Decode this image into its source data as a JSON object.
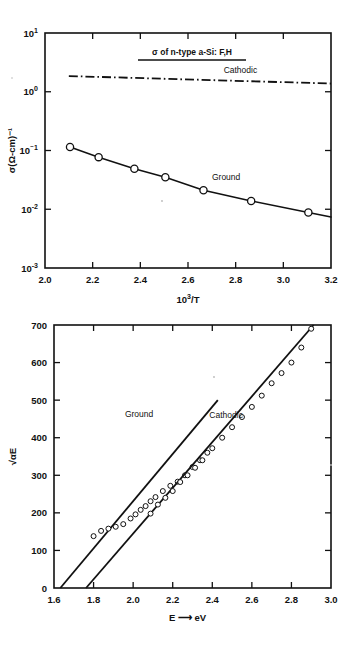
{
  "figure": {
    "name": "conductivity-and-tauc-plots-amorphous-silicon",
    "background_color": "#ffffff",
    "ink_color": "#111111"
  },
  "chart_data": [
    {
      "id": "top",
      "type": "line",
      "title": "σ of n-type a-Si: F,H",
      "title_underlined": true,
      "xlabel": "10³/T",
      "ylabel": "σ(Ω-cm)⁻¹",
      "xlim": [
        2.0,
        3.2
      ],
      "ylim": [
        0.001,
        10
      ],
      "yscale": "log",
      "grid": false,
      "legend_position": "inline-annotation",
      "xticks": [
        2.0,
        2.2,
        2.4,
        2.6,
        2.8,
        3.0,
        3.2
      ],
      "xticklabels": [
        "2.0",
        "2.2",
        "2.4",
        "2.6",
        "2.8",
        "3.0",
        "3.2"
      ],
      "yticks": [
        10,
        1,
        0.1,
        0.01,
        0.001
      ],
      "yticklabels": [
        "10¹",
        "10⁰",
        "10⁻¹",
        "10⁻²",
        "10⁻³"
      ],
      "series": [
        {
          "name": "Cathodic",
          "style": "dash-dot",
          "marker": "none",
          "label_x": 2.82,
          "label_y": 2.05,
          "x": [
            2.1,
            3.2
          ],
          "values": [
            1.85,
            1.38
          ]
        },
        {
          "name": "Ground",
          "style": "solid",
          "marker": "open-circle",
          "label_x": 2.76,
          "label_y": 0.031,
          "x": [
            2.105,
            2.225,
            2.375,
            2.505,
            2.665,
            2.865,
            3.105
          ],
          "values": [
            0.115,
            0.077,
            0.049,
            0.035,
            0.021,
            0.0138,
            0.0088
          ]
        }
      ]
    },
    {
      "id": "bottom",
      "type": "scatter",
      "title": "",
      "xlabel": "E ⟶ eV",
      "ylabel": "√αE",
      "xlim": [
        1.6,
        3.0
      ],
      "ylim": [
        0,
        700
      ],
      "yscale": "linear",
      "grid": false,
      "legend_position": "inline-annotation",
      "xticks": [
        1.6,
        1.8,
        2.0,
        2.2,
        2.4,
        2.6,
        2.8,
        3.0
      ],
      "xticklabels": [
        "1.6",
        "1.8",
        "2.0",
        "2.2",
        "2.4",
        "2.6",
        "2.8",
        "3.0"
      ],
      "yticks": [
        0,
        100,
        200,
        300,
        400,
        500,
        600,
        700
      ],
      "yticklabels": [
        "0",
        "100",
        "200",
        "300",
        "400",
        "500",
        "600",
        "700"
      ],
      "series": [
        {
          "name": "Ground",
          "style": "solid-fit",
          "marker": "open-circle",
          "label_x": 2.03,
          "label_y": 455,
          "fit_x": [
            1.632,
            2.428
          ],
          "fit_y": [
            0,
            500
          ],
          "x": [
            1.8,
            1.838,
            1.875,
            1.912,
            1.95,
            1.987,
            2.012,
            2.038,
            2.063,
            2.088,
            2.113,
            2.15,
            2.188,
            2.225,
            2.262,
            2.3,
            2.338,
            2.375
          ],
          "values": [
            138,
            152,
            158,
            163,
            170,
            185,
            196,
            208,
            218,
            231,
            242,
            258,
            272,
            283,
            300,
            322,
            340,
            360
          ]
        },
        {
          "name": "Cathodic",
          "style": "solid-fit",
          "marker": "open-circle",
          "label_x": 2.47,
          "label_y": 452,
          "fit_x": [
            1.762,
            2.912
          ],
          "fit_y": [
            0,
            700
          ],
          "x": [
            2.088,
            2.125,
            2.163,
            2.2,
            2.238,
            2.275,
            2.313,
            2.35,
            2.4,
            2.45,
            2.5,
            2.55,
            2.6,
            2.65,
            2.7,
            2.75,
            2.8,
            2.85,
            2.9
          ],
          "values": [
            198,
            222,
            240,
            258,
            282,
            300,
            320,
            340,
            372,
            400,
            428,
            455,
            482,
            512,
            545,
            572,
            600,
            640,
            690
          ]
        }
      ]
    }
  ]
}
